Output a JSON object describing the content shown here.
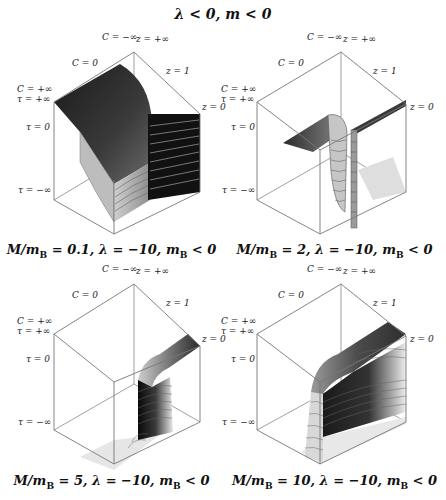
{
  "figure": {
    "title": "λ < 0, m < 0",
    "axis_labels": {
      "c_minus_inf": "C = −∞",
      "z_plus_inf": "z = +∞",
      "c_zero": "C = 0",
      "z_one": "z = 1",
      "c_plus_inf": "C = +∞",
      "tau_plus_inf": "τ = +∞",
      "z_zero": "z = 0",
      "tau_zero": "τ = 0",
      "tau_minus_inf": "τ = −∞"
    },
    "panels": [
      {
        "id": "p1",
        "caption_prefix": "M/m",
        "caption_sub": "B",
        "caption_rest": " = 0.1, λ = −10, m",
        "caption_sub2": "B",
        "caption_end": " < 0",
        "M_over_mB": 0.1,
        "lambda": -10,
        "mB_sign": "< 0"
      },
      {
        "id": "p2",
        "caption_prefix": "M/m",
        "caption_sub": "B",
        "caption_rest": " = 2, λ = −10, m",
        "caption_sub2": "B",
        "caption_end": " < 0",
        "M_over_mB": 2,
        "lambda": -10,
        "mB_sign": "< 0"
      },
      {
        "id": "p3",
        "caption_prefix": "M/m",
        "caption_sub": "B",
        "caption_rest": " = 5, λ = −10, m",
        "caption_sub2": "B",
        "caption_end": " < 0",
        "M_over_mB": 5,
        "lambda": -10,
        "mB_sign": "< 0"
      },
      {
        "id": "p4",
        "caption_prefix": "M/m",
        "caption_sub": "B",
        "caption_rest": " = 10, λ = −10, m",
        "caption_sub2": "B",
        "caption_end": " < 0",
        "M_over_mB": 10,
        "lambda": -10,
        "mB_sign": "< 0"
      }
    ]
  }
}
